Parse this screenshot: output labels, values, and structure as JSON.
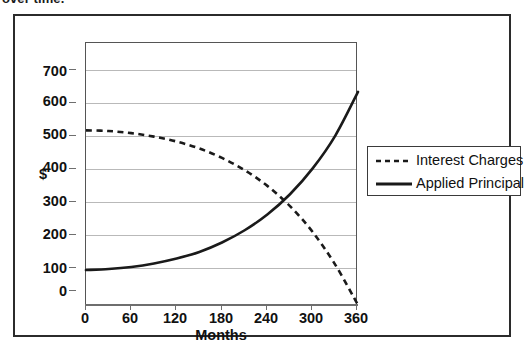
{
  "caption": {
    "text": "over time."
  },
  "chart_data": {
    "type": "line",
    "title": "",
    "xlabel": "Months",
    "ylabel": "$",
    "xlim": [
      0,
      360
    ],
    "ylim": [
      0,
      750
    ],
    "xticks": [
      0,
      60,
      120,
      180,
      240,
      300,
      360
    ],
    "xtick_labels": [
      "0",
      "60",
      "120",
      "180",
      "240",
      "300",
      "360"
    ],
    "yticks": [
      0,
      100,
      200,
      300,
      400,
      500,
      600,
      700
    ],
    "ytick_labels": [
      "0",
      "100",
      "200",
      "300",
      "400",
      "500",
      "600",
      "700"
    ],
    "grid": "horizontal",
    "legend_position": "right",
    "x": [
      0,
      30,
      60,
      90,
      120,
      150,
      180,
      210,
      240,
      270,
      300,
      330,
      360
    ],
    "series": [
      {
        "name": "Interest Charges",
        "style": "dashed",
        "color": "#1a1a1a",
        "values": [
          500,
          498,
          492,
          482,
          468,
          448,
          421,
          386,
          341,
          283,
          209,
          115,
          0
        ]
      },
      {
        "name": "Applied Principal",
        "style": "solid",
        "color": "#1a1a1a",
        "values": [
          100,
          103,
          109,
          119,
          133,
          152,
          179,
          214,
          259,
          317,
          391,
          485,
          610
        ]
      }
    ],
    "annotations": [
      {
        "label": "crossover",
        "x": 268,
        "y": 325
      }
    ]
  },
  "legend": {
    "items": [
      {
        "label": "Interest Charges",
        "style": "dashed"
      },
      {
        "label": "Applied Principal",
        "style": "solid"
      }
    ]
  },
  "colors": {
    "frame": "#2b2b2b",
    "gridline": "#b9b9b9",
    "axis": "#6e6e6e",
    "series": "#1a1a1a",
    "background": "#ffffff"
  }
}
